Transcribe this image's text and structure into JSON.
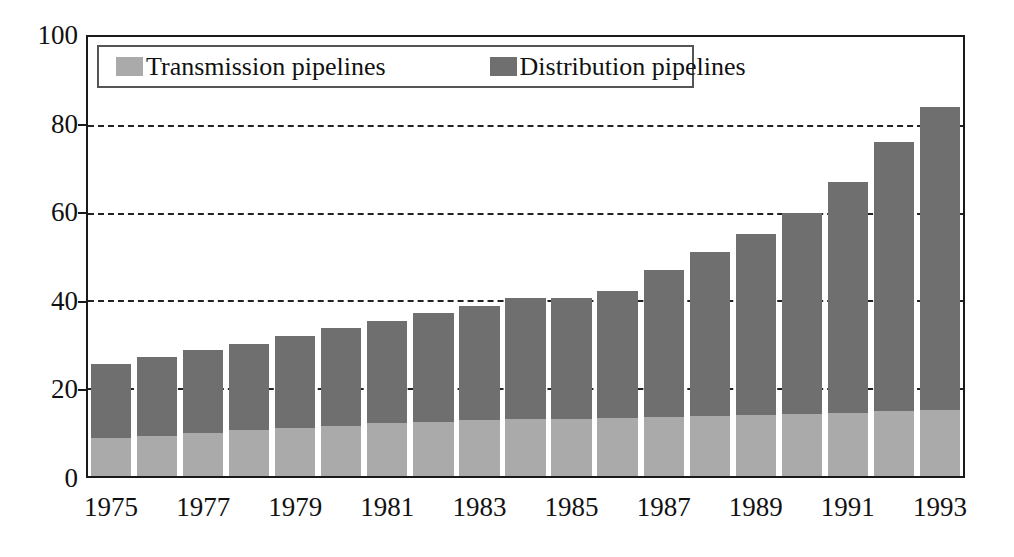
{
  "chart_data": {
    "type": "bar",
    "subtype": "stacked-vertical",
    "title": "",
    "xlabel": "",
    "ylabel": "",
    "ylim": [
      0,
      100
    ],
    "yticks": [
      0,
      20,
      40,
      60,
      80,
      100
    ],
    "gridlines": [
      20,
      40,
      60,
      80
    ],
    "grid": "dashed horizontal gridlines at 20, 40, 60 and 80",
    "legend_position": "top-left inside plot area",
    "categories": [
      "1975",
      "1976",
      "1977",
      "1978",
      "1979",
      "1980",
      "1981",
      "1982",
      "1983",
      "1984",
      "1985",
      "1986",
      "1987",
      "1988",
      "1989",
      "1990",
      "1991",
      "1992",
      "1993"
    ],
    "xtick_labels": [
      "1975",
      "1977",
      "1979",
      "1981",
      "1983",
      "1985",
      "1987",
      "1989",
      "1991",
      "1993"
    ],
    "series": [
      {
        "name": "Transmission pipelines",
        "color": "#aaaaaa",
        "values": [
          8.6,
          9.2,
          9.8,
          10.4,
          11.0,
          11.5,
          12.0,
          12.4,
          12.7,
          12.9,
          13.0,
          13.2,
          13.4,
          13.6,
          13.9,
          14.1,
          14.4,
          14.7,
          15.0
        ]
      },
      {
        "name": "Distribution pipelines",
        "color": "#6f6f6f",
        "values": [
          16.9,
          17.8,
          19.0,
          19.7,
          20.8,
          22.2,
          23.4,
          24.7,
          26.1,
          27.7,
          27.6,
          29.0,
          33.6,
          37.5,
          41.2,
          45.9,
          52.6,
          61.4,
          69.0
        ]
      }
    ],
    "totals": [
      25.5,
      27.0,
      28.8,
      30.1,
      31.8,
      33.7,
      35.4,
      37.1,
      38.8,
      40.6,
      40.6,
      42.2,
      47.0,
      51.1,
      55.1,
      60.0,
      67.0,
      76.1,
      84.0
    ]
  },
  "legend": {
    "entries": [
      {
        "label": "Transmission pipelines",
        "swatch_color": "#aaaaaa",
        "icon": "legend-swatch-icon"
      },
      {
        "label": "Distribution pipelines",
        "swatch_color": "#6f6f6f",
        "icon": "legend-swatch-icon"
      }
    ]
  },
  "axis": {
    "y_tick_labels": [
      "100",
      "80",
      "60",
      "40",
      "20",
      "0"
    ],
    "x_tick_labels": [
      "1975",
      "1977",
      "1979",
      "1981",
      "1983",
      "1985",
      "1987",
      "1989",
      "1991",
      "1993"
    ]
  },
  "colors": {
    "transmission": "#aaaaaa",
    "distribution": "#6f6f6f",
    "frame": "#1a1a1a",
    "grid": "#222222",
    "text": "#111111",
    "background": "#ffffff"
  }
}
